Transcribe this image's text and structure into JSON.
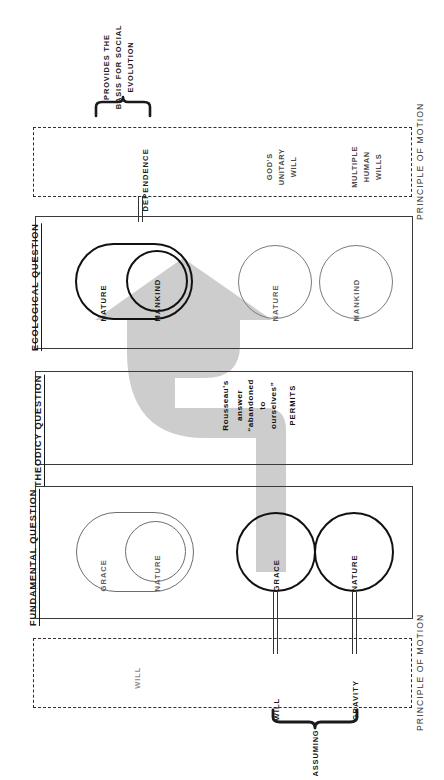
{
  "diagram": {
    "title_note_top": {
      "line1": "PROVIDES THE",
      "line2": "BASIS FOR SOCIAL",
      "line3": "EVOLUTION"
    },
    "brace_bottom_label": "ASSUMING"
  },
  "panels": [
    {
      "id": "ecological",
      "label": "ECOLOGICAL QUESTION",
      "shapes": [
        {
          "id": "eco-outer-nature",
          "label": "NATURE",
          "style": "bold-stadium"
        },
        {
          "id": "eco-inner-mankind",
          "label": "MANKIND",
          "style": "bold-circle"
        },
        {
          "id": "eco-right-nature",
          "label": "NATURE",
          "style": "thin-circle"
        },
        {
          "id": "eco-right-mankind",
          "label": "MANKIND",
          "style": "thin-circle"
        }
      ]
    },
    {
      "id": "theodicy",
      "label": "THEODICY QUESTION",
      "shapes": []
    },
    {
      "id": "fundamental",
      "label": "FUNDAMENTAL QUESTION",
      "shapes": [
        {
          "id": "fund-outer-grace",
          "label": "GRACE",
          "style": "thin-stadium"
        },
        {
          "id": "fund-inner-nature",
          "label": "NATURE",
          "style": "thin-circle"
        },
        {
          "id": "fund-right-grace",
          "label": "GRACE",
          "style": "bold-circle"
        },
        {
          "id": "fund-right-nature",
          "label": "NATURE",
          "style": "bold-circle"
        }
      ]
    }
  ],
  "principle_boxes": [
    {
      "id": "pom-top",
      "label": "PRINCIPLE OF MOTION",
      "entries": [
        {
          "id": "pom-top-dependence",
          "text": "DEPENDENCE",
          "emphasis": "bold"
        },
        {
          "id": "pom-top-gods-will",
          "text": "GOD'S\nUNITARY\nWILL",
          "emphasis": "normal"
        },
        {
          "id": "pom-top-human-wills",
          "text": "MULTIPLE\nHUMAN\nWILLS",
          "emphasis": "normal"
        }
      ]
    },
    {
      "id": "pom-bottom",
      "label": "PRINCIPLE OF MOTION",
      "entries": [
        {
          "id": "pom-bottom-will-faint",
          "text": "WILL",
          "emphasis": "faint"
        },
        {
          "id": "pom-bottom-will",
          "text": "WILL",
          "emphasis": "bold"
        },
        {
          "id": "pom-bottom-gravity",
          "text": "GRAVITY",
          "emphasis": "bold"
        }
      ]
    }
  ],
  "arrow": {
    "id": "rousseau-arrow",
    "color": "#c9c9c9",
    "lines": [
      "Rousseau's",
      "answer",
      "“abandoned",
      "to",
      "ourselves”"
    ],
    "tail_label": "PERMITS"
  },
  "pom_top_labels": {
    "gods_will_l1": "GOD'S",
    "gods_will_l2": "UNITARY",
    "gods_will_l3": "WILL",
    "human_wills_l1": "MULTIPLE",
    "human_wills_l2": "HUMAN",
    "human_wills_l3": "WILLS"
  },
  "arrow_lines": {
    "l1": "Rousseau's",
    "l2": "answer",
    "l3": "“abandoned",
    "l4": "to",
    "l5": "ourselves”",
    "permits": "PERMITS"
  }
}
